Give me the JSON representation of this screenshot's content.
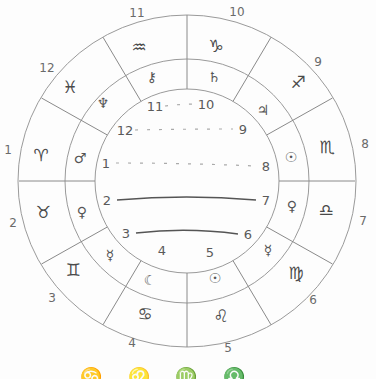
{
  "wheel": {
    "center": {
      "x": 187,
      "y": 181
    },
    "radii": {
      "outer": 166,
      "middle": 122,
      "inner": 92
    },
    "outer_house_numbers": [
      {
        "label": "1",
        "x": 8,
        "y": 150
      },
      {
        "label": "2",
        "x": 13,
        "y": 223
      },
      {
        "label": "3",
        "x": 52,
        "y": 298
      },
      {
        "label": "4",
        "x": 132,
        "y": 343
      },
      {
        "label": "5",
        "x": 228,
        "y": 348
      },
      {
        "label": "6",
        "x": 313,
        "y": 300
      },
      {
        "label": "7",
        "x": 363,
        "y": 221
      },
      {
        "label": "8",
        "x": 365,
        "y": 144
      },
      {
        "label": "9",
        "x": 318,
        "y": 62
      },
      {
        "label": "10",
        "x": 237,
        "y": 12
      },
      {
        "label": "11",
        "x": 137,
        "y": 13
      },
      {
        "label": "12",
        "x": 47,
        "y": 68
      }
    ],
    "signs": [
      {
        "name": "aries",
        "glyph": "♈",
        "x": 41,
        "y": 155
      },
      {
        "name": "taurus",
        "glyph": "♉",
        "x": 43,
        "y": 212
      },
      {
        "name": "gemini",
        "glyph": "♊",
        "x": 73,
        "y": 270
      },
      {
        "name": "cancer",
        "glyph": "♋",
        "x": 145,
        "y": 314
      },
      {
        "name": "leo",
        "glyph": "♌",
        "x": 221,
        "y": 316
      },
      {
        "name": "virgo",
        "glyph": "♍",
        "x": 296,
        "y": 273
      },
      {
        "name": "libra",
        "glyph": "♎",
        "x": 326,
        "y": 210
      },
      {
        "name": "scorpio",
        "glyph": "♏",
        "x": 327,
        "y": 147
      },
      {
        "name": "sagittarius",
        "glyph": "♐",
        "x": 298,
        "y": 82
      },
      {
        "name": "capricorn",
        "glyph": "♑",
        "x": 216,
        "y": 46
      },
      {
        "name": "aquarius",
        "glyph": "♒",
        "x": 139,
        "y": 47
      },
      {
        "name": "pisces",
        "glyph": "♓",
        "x": 70,
        "y": 87
      }
    ],
    "planets": [
      {
        "name": "mars",
        "glyph": "♂",
        "x": 80,
        "y": 158
      },
      {
        "name": "venus",
        "glyph": "♀",
        "x": 82,
        "y": 212
      },
      {
        "name": "mercury",
        "glyph": "☿",
        "x": 110,
        "y": 255
      },
      {
        "name": "moon",
        "glyph": "☾",
        "x": 150,
        "y": 280
      },
      {
        "name": "sun",
        "glyph": "☉",
        "x": 215,
        "y": 278
      },
      {
        "name": "mercury",
        "glyph": "☿",
        "x": 268,
        "y": 250
      },
      {
        "name": "venus",
        "glyph": "♀",
        "x": 292,
        "y": 206
      },
      {
        "name": "sun",
        "glyph": "☉",
        "x": 291,
        "y": 157
      },
      {
        "name": "jupiter",
        "glyph": "♃",
        "x": 263,
        "y": 110
      },
      {
        "name": "saturn",
        "glyph": "♄",
        "x": 214,
        "y": 77
      },
      {
        "name": "chiron",
        "glyph": "⚷",
        "x": 152,
        "y": 77
      },
      {
        "name": "neptune",
        "glyph": "♆",
        "x": 103,
        "y": 103
      }
    ],
    "inner_house_numbers": [
      {
        "label": "11",
        "x": 155,
        "y": 106
      },
      {
        "label": "10",
        "x": 206,
        "y": 104
      },
      {
        "label": "12",
        "x": 125,
        "y": 130
      },
      {
        "label": "9",
        "x": 243,
        "y": 129
      },
      {
        "label": "1",
        "x": 106,
        "y": 163
      },
      {
        "label": "8",
        "x": 266,
        "y": 166
      },
      {
        "label": "2",
        "x": 107,
        "y": 200
      },
      {
        "label": "7",
        "x": 266,
        "y": 200
      },
      {
        "label": "3",
        "x": 126,
        "y": 233
      },
      {
        "label": "6",
        "x": 248,
        "y": 234
      },
      {
        "label": "4",
        "x": 162,
        "y": 250
      },
      {
        "label": "5",
        "x": 210,
        "y": 252
      }
    ],
    "connections": [
      {
        "from": "11",
        "to": "10",
        "style": "dashed"
      },
      {
        "from": "12",
        "to": "9",
        "style": "dashed"
      },
      {
        "from": "1",
        "to": "8",
        "style": "dashed"
      },
      {
        "from": "2",
        "to": "7",
        "style": "solid"
      },
      {
        "from": "3",
        "to": "6",
        "style": "solid"
      }
    ]
  },
  "caption": {
    "text": "♋ ♌ ♍ ♎ ♏"
  }
}
